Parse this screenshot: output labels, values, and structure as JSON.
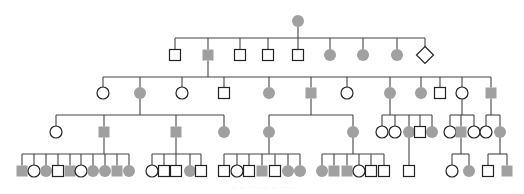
{
  "colors": {
    "affected": "#a0a0a0",
    "unaffected_fill": "#ffffff",
    "outline": "#222222",
    "line": "#444444"
  },
  "caption": "··· ·· ·· ···· ·· ·····",
  "symbol_size": 11,
  "generations": [
    {
      "id": "I",
      "y": 21,
      "members": [
        {
          "id": "I-1",
          "sex": "female",
          "affected": true,
          "x": 298
        }
      ]
    },
    {
      "id": "II",
      "y": 55,
      "members": [
        {
          "id": "II-1",
          "sex": "male",
          "affected": false,
          "x": 175
        },
        {
          "id": "II-2",
          "sex": "male",
          "affected": true,
          "x": 208
        },
        {
          "id": "II-3",
          "sex": "male",
          "affected": false,
          "x": 240
        },
        {
          "id": "II-4",
          "sex": "male",
          "affected": false,
          "x": 268
        },
        {
          "id": "II-5",
          "sex": "male",
          "affected": false,
          "x": 298
        },
        {
          "id": "II-6",
          "sex": "female",
          "affected": true,
          "x": 330
        },
        {
          "id": "II-7",
          "sex": "female",
          "affected": true,
          "x": 363
        },
        {
          "id": "II-8",
          "sex": "female",
          "affected": true,
          "x": 397
        },
        {
          "id": "II-9",
          "sex": "unknown",
          "affected": false,
          "x": 425
        }
      ]
    },
    {
      "id": "III",
      "y": 93,
      "members": [
        {
          "id": "III-1",
          "sex": "female",
          "affected": false,
          "x": 103
        },
        {
          "id": "III-2",
          "sex": "female",
          "affected": true,
          "x": 140
        },
        {
          "id": "III-3",
          "sex": "female",
          "affected": false,
          "x": 182
        },
        {
          "id": "III-4",
          "sex": "male",
          "affected": false,
          "x": 224
        },
        {
          "id": "III-5",
          "sex": "female",
          "affected": true,
          "x": 269
        },
        {
          "id": "III-6",
          "sex": "male",
          "affected": true,
          "x": 311
        },
        {
          "id": "III-7",
          "sex": "female",
          "affected": false,
          "x": 347
        },
        {
          "id": "III-8",
          "sex": "female",
          "affected": true,
          "x": 390
        },
        {
          "id": "III-9",
          "sex": "female",
          "affected": true,
          "x": 421
        },
        {
          "id": "III-10",
          "sex": "male",
          "affected": false,
          "x": 440
        },
        {
          "id": "III-11",
          "sex": "female",
          "affected": false,
          "x": 462
        },
        {
          "id": "III-12",
          "sex": "male",
          "affected": true,
          "x": 491
        }
      ]
    },
    {
      "id": "IV",
      "y": 132,
      "members": [
        {
          "id": "IV-1",
          "sex": "female",
          "affected": false,
          "x": 56
        },
        {
          "id": "IV-2",
          "sex": "male",
          "affected": true,
          "x": 104
        },
        {
          "id": "IV-3",
          "sex": "male",
          "affected": true,
          "x": 176
        },
        {
          "id": "IV-4",
          "sex": "female",
          "affected": true,
          "x": 224
        },
        {
          "id": "IV-5",
          "sex": "female",
          "affected": true,
          "x": 269
        },
        {
          "id": "IV-6",
          "sex": "female",
          "affected": true,
          "x": 353
        },
        {
          "id": "IV-7",
          "sex": "female",
          "affected": false,
          "x": 382
        },
        {
          "id": "IV-8",
          "sex": "female",
          "affected": false,
          "x": 395
        },
        {
          "id": "IV-9",
          "sex": "female",
          "affected": true,
          "x": 409
        },
        {
          "id": "IV-10",
          "sex": "male",
          "affected": false,
          "x": 420
        },
        {
          "id": "IV-11",
          "sex": "female",
          "affected": true,
          "x": 432
        },
        {
          "id": "IV-12",
          "sex": "female",
          "affected": false,
          "x": 450
        },
        {
          "id": "IV-13",
          "sex": "male",
          "affected": true,
          "x": 461
        },
        {
          "id": "IV-14",
          "sex": "female",
          "affected": false,
          "x": 474
        },
        {
          "id": "IV-15",
          "sex": "female",
          "affected": false,
          "x": 486
        },
        {
          "id": "IV-16",
          "sex": "female",
          "affected": true,
          "x": 500
        }
      ]
    },
    {
      "id": "V",
      "y": 171,
      "members": [
        {
          "id": "V-1",
          "sex": "male",
          "affected": true,
          "x": 22
        },
        {
          "id": "V-2",
          "sex": "female",
          "affected": false,
          "x": 34
        },
        {
          "id": "V-3",
          "sex": "female",
          "affected": true,
          "x": 46
        },
        {
          "id": "V-4",
          "sex": "male",
          "affected": false,
          "x": 58
        },
        {
          "id": "V-5",
          "sex": "male",
          "affected": true,
          "x": 70
        },
        {
          "id": "V-6",
          "sex": "female",
          "affected": false,
          "x": 81
        },
        {
          "id": "V-7",
          "sex": "female",
          "affected": true,
          "x": 93
        },
        {
          "id": "V-8",
          "sex": "female",
          "affected": true,
          "x": 105
        },
        {
          "id": "V-9",
          "sex": "male",
          "affected": true,
          "x": 117
        },
        {
          "id": "V-10",
          "sex": "female",
          "affected": true,
          "x": 129
        },
        {
          "id": "V-11",
          "sex": "female",
          "affected": false,
          "x": 152
        },
        {
          "id": "V-12",
          "sex": "male",
          "affected": false,
          "x": 164
        },
        {
          "id": "V-13",
          "sex": "male",
          "affected": false,
          "x": 176
        },
        {
          "id": "V-14",
          "sex": "female",
          "affected": true,
          "x": 190
        },
        {
          "id": "V-15",
          "sex": "male",
          "affected": false,
          "x": 201
        },
        {
          "id": "V-16",
          "sex": "male",
          "affected": false,
          "x": 224
        },
        {
          "id": "V-17",
          "sex": "female",
          "affected": false,
          "x": 237
        },
        {
          "id": "V-18",
          "sex": "male",
          "affected": false,
          "x": 249
        },
        {
          "id": "V-19",
          "sex": "male",
          "affected": true,
          "x": 262
        },
        {
          "id": "V-20",
          "sex": "male",
          "affected": false,
          "x": 275
        },
        {
          "id": "V-21",
          "sex": "female",
          "affected": true,
          "x": 288
        },
        {
          "id": "V-22",
          "sex": "female",
          "affected": true,
          "x": 300
        },
        {
          "id": "V-23",
          "sex": "female",
          "affected": true,
          "x": 322
        },
        {
          "id": "V-24",
          "sex": "male",
          "affected": true,
          "x": 334
        },
        {
          "id": "V-25",
          "sex": "male",
          "affected": true,
          "x": 347
        },
        {
          "id": "V-26",
          "sex": "female",
          "affected": false,
          "x": 359
        },
        {
          "id": "V-27",
          "sex": "male",
          "affected": false,
          "x": 371
        },
        {
          "id": "V-28",
          "sex": "male",
          "affected": false,
          "x": 384
        },
        {
          "id": "V-29",
          "sex": "male",
          "affected": false,
          "x": 409
        },
        {
          "id": "V-30",
          "sex": "female",
          "affected": false,
          "x": 452
        },
        {
          "id": "V-31",
          "sex": "female",
          "affected": true,
          "x": 469
        },
        {
          "id": "V-32",
          "sex": "male",
          "affected": false,
          "x": 488
        },
        {
          "id": "V-33",
          "sex": "male",
          "affected": true,
          "x": 507
        }
      ]
    }
  ],
  "sibships": [
    {
      "parent_x": 298,
      "parent_y": 21,
      "bar_y": 38,
      "children": [
        "II-1",
        "II-2",
        "II-3",
        "II-4",
        "II-5",
        "II-6",
        "II-7",
        "II-8",
        "II-9"
      ]
    },
    {
      "parent_x": 208,
      "parent_y": 55,
      "bar_y": 77,
      "children": [
        "III-1",
        "III-2",
        "III-3",
        "III-4",
        "III-5",
        "III-6",
        "III-7",
        "III-8",
        "III-9",
        "III-10",
        "III-11",
        "III-12"
      ]
    },
    {
      "parent_x": 140,
      "parent_y": 93,
      "bar_y": 115,
      "children": [
        "IV-1",
        "IV-2",
        "IV-3",
        "IV-4"
      ]
    },
    {
      "parent_x": 311,
      "parent_y": 93,
      "bar_y": 115,
      "children": [
        "IV-5",
        "IV-6"
      ]
    },
    {
      "parent_x": 390,
      "parent_y": 93,
      "bar_y": 115,
      "children": [
        "IV-7",
        "IV-8",
        "IV-9",
        "IV-10",
        "IV-11"
      ]
    },
    {
      "parent_x": 462,
      "parent_y": 93,
      "bar_y": 115,
      "children": [
        "IV-12",
        "IV-13",
        "IV-14"
      ]
    },
    {
      "parent_x": 491,
      "parent_y": 93,
      "bar_y": 115,
      "children": [
        "IV-15",
        "IV-16"
      ]
    },
    {
      "parent_x": 104,
      "parent_y": 132,
      "bar_y": 154,
      "children": [
        "V-1",
        "V-2",
        "V-3",
        "V-4",
        "V-5",
        "V-6",
        "V-7",
        "V-8",
        "V-9",
        "V-10"
      ]
    },
    {
      "parent_x": 176,
      "parent_y": 132,
      "bar_y": 154,
      "children": [
        "V-11",
        "V-12",
        "V-13",
        "V-14",
        "V-15"
      ]
    },
    {
      "parent_x": 269,
      "parent_y": 132,
      "bar_y": 154,
      "children": [
        "V-16",
        "V-17",
        "V-18",
        "V-19",
        "V-20",
        "V-21",
        "V-22"
      ]
    },
    {
      "parent_x": 353,
      "parent_y": 132,
      "bar_y": 154,
      "children": [
        "V-23",
        "V-24",
        "V-25",
        "V-26",
        "V-27",
        "V-28"
      ]
    },
    {
      "parent_x": 409,
      "parent_y": 132,
      "bar_y": 154,
      "children": [
        "V-29"
      ]
    },
    {
      "parent_x": 461,
      "parent_y": 132,
      "bar_y": 154,
      "children": [
        "V-30",
        "V-31"
      ]
    },
    {
      "parent_x": 500,
      "parent_y": 132,
      "bar_y": 154,
      "children": [
        "V-32",
        "V-33"
      ]
    }
  ]
}
